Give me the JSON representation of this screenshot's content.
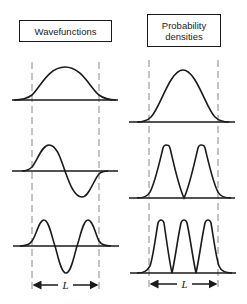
{
  "panels": {
    "left": {
      "title": "Wavefunctions",
      "curves": [
        {
          "n": 1,
          "type": "wavefunction",
          "description": "single positive hump"
        },
        {
          "n": 2,
          "type": "wavefunction",
          "description": "one positive lobe, one negative lobe"
        },
        {
          "n": 3,
          "type": "wavefunction",
          "description": "positive, negative, positive lobes"
        }
      ],
      "length_label": "L"
    },
    "right": {
      "title_line1": "Probability",
      "title_line2": "densities",
      "curves": [
        {
          "n": 1,
          "type": "probability_density",
          "description": "single peak"
        },
        {
          "n": 2,
          "type": "probability_density",
          "description": "two peaks"
        },
        {
          "n": 3,
          "type": "probability_density",
          "description": "three peaks"
        }
      ],
      "length_label": "L"
    }
  },
  "colors": {
    "stroke": "#1a1a1a",
    "dashed": "#888888",
    "background": "#ffffff"
  }
}
